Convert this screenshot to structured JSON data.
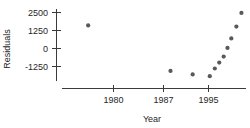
{
  "chart_data": {
    "type": "scatter",
    "title": "",
    "subtitle": "",
    "xlabel": "Year",
    "ylabel": "Residuals",
    "grid": false,
    "legend": null,
    "legend_position": "none",
    "xlim": [
      1975,
      2001
    ],
    "ylim": [
      -2000,
      2800
    ],
    "x_ticks": [
      1980,
      1987,
      1995
    ],
    "x_tick_labels": [
      "1980",
      "1987",
      "1995"
    ],
    "y_ticks": [
      2500,
      1250,
      0,
      -1250
    ],
    "y_tick_labels": [
      "2500",
      "1250",
      "0",
      "-1250"
    ],
    "marker": "filled-circle",
    "marker_color": "#595959",
    "series": [
      {
        "name": "Residuals",
        "x": [
          1976,
          1989,
          1992.5,
          1995.2,
          1996.0,
          1996.7,
          1997.4,
          1998.0,
          1998.6,
          1999.4,
          2000.2
        ],
        "y": [
          1600,
          -1560,
          -1800,
          -1920,
          -1390,
          -980,
          -560,
          40,
          700,
          1520,
          2470
        ]
      }
    ],
    "points": [
      {
        "x": 1976,
        "y": 1600
      },
      {
        "x": 1989,
        "y": -1560
      },
      {
        "x": 1992.5,
        "y": -1800
      },
      {
        "x": 1995.2,
        "y": -1920
      },
      {
        "x": 1996.0,
        "y": -1390
      },
      {
        "x": 1996.7,
        "y": -980
      },
      {
        "x": 1997.4,
        "y": -560
      },
      {
        "x": 1998.0,
        "y": 40
      },
      {
        "x": 1998.6,
        "y": 700
      },
      {
        "x": 1999.4,
        "y": 1520
      },
      {
        "x": 2000.2,
        "y": 2470
      }
    ]
  },
  "axes": {
    "y_axis_name": "y-axis",
    "x_axis_name": "x-axis"
  }
}
